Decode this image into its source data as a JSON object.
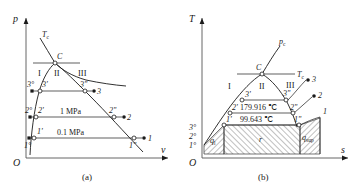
{
  "figure": {
    "caption_a": "(a)",
    "caption_b": "(b)"
  },
  "panel_a": {
    "name": "p-v diagram",
    "axes": {
      "x_label": "v",
      "y_label": "p",
      "origin_label": "O"
    },
    "critical_point_label": "C",
    "critical_isotherm_label": "T",
    "critical_isotherm_sub": "c",
    "regions": [
      "I",
      "II",
      "III"
    ],
    "isobars": [
      {
        "label": "0.1 MPa",
        "points": [
          "1°",
          "1'",
          "1\"",
          "1"
        ]
      },
      {
        "label": "1 MPa",
        "points": [
          "2°",
          "2'",
          "2\"",
          "2"
        ]
      },
      {
        "label": "",
        "points": [
          "3°",
          "3'",
          "3\"",
          "3"
        ]
      }
    ],
    "point_labels": [
      "1°",
      "1'",
      "1\"",
      "1",
      "2°",
      "2'",
      "2\"",
      "2",
      "3°",
      "3'",
      "3\"",
      "3"
    ]
  },
  "panel_b": {
    "name": "T-s diagram",
    "axes": {
      "x_label": "s",
      "y_label": "T",
      "origin_label": "O"
    },
    "critical_point_label": "C",
    "critical_pressure_label": "p",
    "critical_pressure_sub": "c",
    "critical_isotherm_label": "T",
    "critical_isotherm_sub": "c",
    "regions": [
      "I",
      "II",
      "III"
    ],
    "temperatures": [
      {
        "point": "2'",
        "value": "179.916 ℃"
      },
      {
        "point": "1'",
        "value": "99.643 ℃"
      }
    ],
    "axis_ticks": [
      "3°",
      "2°",
      "1°"
    ],
    "heat_areas": [
      {
        "symbol": "q",
        "sub": "l",
        "name": "liquid-heating-area"
      },
      {
        "symbol": "r",
        "sub": "",
        "name": "latent-heat-area"
      },
      {
        "symbol": "q",
        "sub": "sup",
        "name": "superheat-area"
      }
    ],
    "point_labels": [
      "1'",
      "1\"",
      "1",
      "2'",
      "2\"",
      "2",
      "3'",
      "3\"",
      "3"
    ]
  },
  "colors": {
    "ink": "#1a1a1a",
    "axis": "#555555",
    "paper": "#ffffff"
  }
}
